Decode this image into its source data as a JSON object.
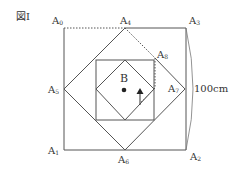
{
  "figure": {
    "title": "図Ⅰ",
    "dimension_label": "100cm",
    "point_label": "B",
    "vertex_labels": {
      "A0": {
        "base": "A",
        "sub": "0"
      },
      "A1": {
        "base": "A",
        "sub": "1"
      },
      "A2": {
        "base": "A",
        "sub": "2"
      },
      "A3": {
        "base": "A",
        "sub": "3"
      },
      "A4": {
        "base": "A",
        "sub": "4"
      },
      "A5": {
        "base": "A",
        "sub": "5"
      },
      "A6": {
        "base": "A",
        "sub": "6"
      },
      "A7": {
        "base": "A",
        "sub": "7"
      },
      "A8": {
        "base": "A",
        "sub": "8"
      }
    },
    "colors": {
      "line": "#555555",
      "text": "#333333",
      "background": "#ffffff"
    }
  }
}
